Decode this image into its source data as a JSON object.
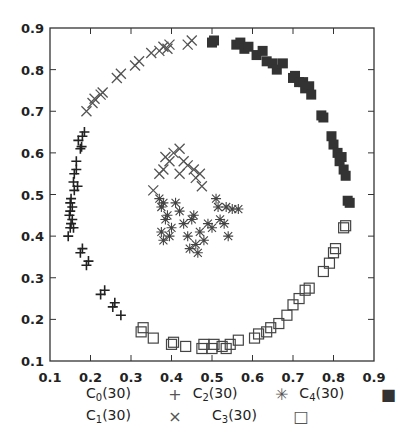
{
  "chart_data": {
    "type": "scatter",
    "title": "",
    "xlabel": "",
    "ylabel": "",
    "xlim": [
      0.1,
      0.9
    ],
    "ylim": [
      0.1,
      0.9
    ],
    "grid": false,
    "legend_position": "bottom",
    "x_ticks": [
      "0.1",
      "0.2",
      "0.3",
      "0.4",
      "0.5",
      "0.6",
      "0.7",
      "0.8",
      "0.9"
    ],
    "y_ticks": [
      "0.1",
      "0.2",
      "0.3",
      "0.4",
      "0.5",
      "0.6",
      "0.7",
      "0.8",
      "0.9"
    ],
    "series": [
      {
        "name": "C0(30)",
        "base": "C",
        "sub": "0",
        "count": "(30)",
        "marker": "plus",
        "color": "#222222",
        "points": [
          [
            0.145,
            0.4
          ],
          [
            0.15,
            0.42
          ],
          [
            0.148,
            0.45
          ],
          [
            0.15,
            0.46
          ],
          [
            0.155,
            0.44
          ],
          [
            0.15,
            0.48
          ],
          [
            0.152,
            0.49
          ],
          [
            0.155,
            0.47
          ],
          [
            0.16,
            0.51
          ],
          [
            0.158,
            0.53
          ],
          [
            0.16,
            0.55
          ],
          [
            0.165,
            0.56
          ],
          [
            0.165,
            0.58
          ],
          [
            0.175,
            0.61
          ],
          [
            0.178,
            0.615
          ],
          [
            0.18,
            0.64
          ],
          [
            0.185,
            0.65
          ],
          [
            0.175,
            0.36
          ],
          [
            0.18,
            0.37
          ],
          [
            0.19,
            0.33
          ],
          [
            0.195,
            0.34
          ],
          [
            0.225,
            0.26
          ],
          [
            0.235,
            0.27
          ],
          [
            0.255,
            0.23
          ],
          [
            0.26,
            0.24
          ],
          [
            0.275,
            0.21
          ],
          [
            0.158,
            0.42
          ],
          [
            0.17,
            0.63
          ],
          [
            0.168,
            0.52
          ],
          [
            0.152,
            0.43
          ]
        ]
      },
      {
        "name": "C1(30)",
        "base": "C",
        "sub": "1",
        "count": "(30)",
        "marker": "x",
        "color": "#555555",
        "points": [
          [
            0.19,
            0.7
          ],
          [
            0.205,
            0.72
          ],
          [
            0.21,
            0.73
          ],
          [
            0.225,
            0.74
          ],
          [
            0.23,
            0.745
          ],
          [
            0.265,
            0.78
          ],
          [
            0.275,
            0.79
          ],
          [
            0.31,
            0.81
          ],
          [
            0.32,
            0.82
          ],
          [
            0.35,
            0.84
          ],
          [
            0.37,
            0.845
          ],
          [
            0.38,
            0.855
          ],
          [
            0.39,
            0.85
          ],
          [
            0.395,
            0.86
          ],
          [
            0.44,
            0.86
          ],
          [
            0.45,
            0.87
          ],
          [
            0.355,
            0.51
          ],
          [
            0.37,
            0.55
          ],
          [
            0.38,
            0.56
          ],
          [
            0.385,
            0.59
          ],
          [
            0.395,
            0.58
          ],
          [
            0.405,
            0.6
          ],
          [
            0.42,
            0.61
          ],
          [
            0.43,
            0.58
          ],
          [
            0.44,
            0.57
          ],
          [
            0.42,
            0.55
          ],
          [
            0.455,
            0.56
          ],
          [
            0.47,
            0.55
          ],
          [
            0.475,
            0.52
          ],
          [
            0.46,
            0.54
          ]
        ]
      },
      {
        "name": "C2(30)",
        "base": "C",
        "sub": "2",
        "count": "(30)",
        "marker": "asterisk",
        "color": "#444444",
        "points": [
          [
            0.37,
            0.49
          ],
          [
            0.375,
            0.47
          ],
          [
            0.38,
            0.48
          ],
          [
            0.385,
            0.44
          ],
          [
            0.39,
            0.45
          ],
          [
            0.4,
            0.42
          ],
          [
            0.375,
            0.41
          ],
          [
            0.38,
            0.39
          ],
          [
            0.395,
            0.4
          ],
          [
            0.41,
            0.48
          ],
          [
            0.42,
            0.46
          ],
          [
            0.43,
            0.43
          ],
          [
            0.44,
            0.4
          ],
          [
            0.445,
            0.37
          ],
          [
            0.45,
            0.44
          ],
          [
            0.455,
            0.45
          ],
          [
            0.46,
            0.38
          ],
          [
            0.465,
            0.36
          ],
          [
            0.47,
            0.41
          ],
          [
            0.48,
            0.39
          ],
          [
            0.49,
            0.43
          ],
          [
            0.5,
            0.42
          ],
          [
            0.51,
            0.49
          ],
          [
            0.515,
            0.47
          ],
          [
            0.52,
            0.44
          ],
          [
            0.53,
            0.43
          ],
          [
            0.535,
            0.47
          ],
          [
            0.54,
            0.4
          ],
          [
            0.55,
            0.465
          ],
          [
            0.565,
            0.465
          ]
        ]
      },
      {
        "name": "C3(30)",
        "base": "C",
        "sub": "3",
        "count": "(30)",
        "marker": "square-open",
        "color": "#444444",
        "points": [
          [
            0.325,
            0.17
          ],
          [
            0.33,
            0.18
          ],
          [
            0.355,
            0.155
          ],
          [
            0.4,
            0.14
          ],
          [
            0.405,
            0.145
          ],
          [
            0.435,
            0.135
          ],
          [
            0.475,
            0.13
          ],
          [
            0.48,
            0.14
          ],
          [
            0.5,
            0.13
          ],
          [
            0.505,
            0.14
          ],
          [
            0.525,
            0.135
          ],
          [
            0.535,
            0.13
          ],
          [
            0.545,
            0.14
          ],
          [
            0.565,
            0.15
          ],
          [
            0.605,
            0.155
          ],
          [
            0.615,
            0.165
          ],
          [
            0.635,
            0.17
          ],
          [
            0.645,
            0.18
          ],
          [
            0.665,
            0.19
          ],
          [
            0.685,
            0.21
          ],
          [
            0.7,
            0.235
          ],
          [
            0.715,
            0.25
          ],
          [
            0.73,
            0.27
          ],
          [
            0.74,
            0.275
          ],
          [
            0.775,
            0.315
          ],
          [
            0.79,
            0.335
          ],
          [
            0.8,
            0.36
          ],
          [
            0.805,
            0.37
          ],
          [
            0.825,
            0.42
          ],
          [
            0.83,
            0.425
          ]
        ]
      },
      {
        "name": "C4(30)",
        "base": "C",
        "sub": "4",
        "count": "(30)",
        "marker": "square-filled",
        "color": "#333333",
        "points": [
          [
            0.5,
            0.865
          ],
          [
            0.505,
            0.87
          ],
          [
            0.56,
            0.86
          ],
          [
            0.57,
            0.865
          ],
          [
            0.58,
            0.85
          ],
          [
            0.59,
            0.855
          ],
          [
            0.61,
            0.835
          ],
          [
            0.625,
            0.845
          ],
          [
            0.635,
            0.82
          ],
          [
            0.65,
            0.815
          ],
          [
            0.66,
            0.8
          ],
          [
            0.675,
            0.815
          ],
          [
            0.7,
            0.78
          ],
          [
            0.705,
            0.785
          ],
          [
            0.715,
            0.77
          ],
          [
            0.725,
            0.77
          ],
          [
            0.73,
            0.755
          ],
          [
            0.74,
            0.76
          ],
          [
            0.745,
            0.74
          ],
          [
            0.77,
            0.69
          ],
          [
            0.775,
            0.685
          ],
          [
            0.795,
            0.64
          ],
          [
            0.8,
            0.62
          ],
          [
            0.81,
            0.6
          ],
          [
            0.82,
            0.59
          ],
          [
            0.815,
            0.58
          ],
          [
            0.825,
            0.56
          ],
          [
            0.83,
            0.545
          ],
          [
            0.835,
            0.485
          ],
          [
            0.84,
            0.48
          ]
        ]
      }
    ]
  }
}
